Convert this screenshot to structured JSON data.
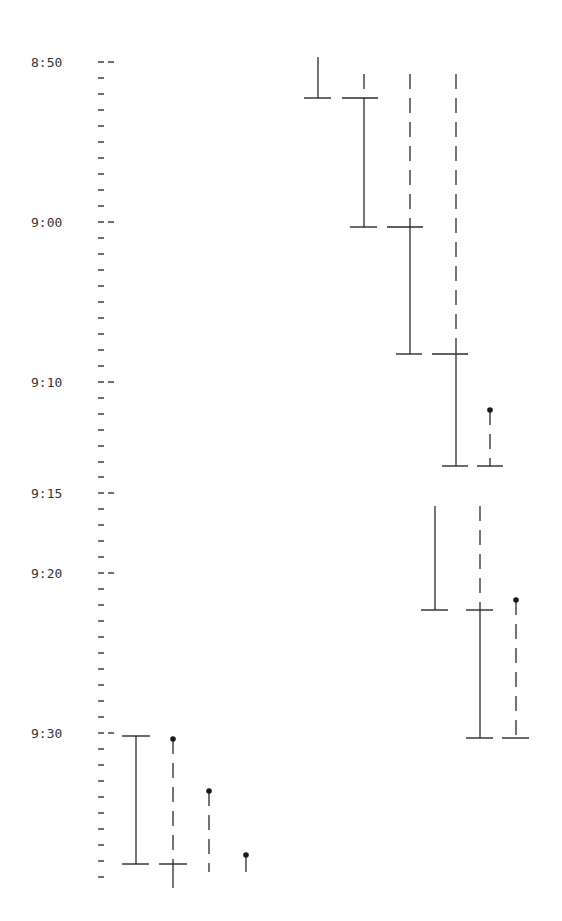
{
  "chart_data": {
    "type": "gantt-timeline",
    "title": "",
    "xlabel": "",
    "ylabel": "Time",
    "y_axis": {
      "direction": "downward",
      "range": [
        "8:50",
        "9:39"
      ],
      "labeled_ticks": [
        {
          "label": "8:50",
          "y": 62
        },
        {
          "label": "9:00",
          "y": 222
        },
        {
          "label": "9:10",
          "y": 382
        },
        {
          "label": "9:15",
          "y": 493
        },
        {
          "label": "9:20",
          "y": 573
        },
        {
          "label": "9:30",
          "y": 733
        }
      ],
      "minor_ticks_y": [
        78,
        94,
        110,
        126,
        142,
        158,
        174,
        190,
        206,
        238,
        254,
        270,
        286,
        302,
        318,
        334,
        350,
        366,
        398,
        414,
        430,
        446,
        462,
        477,
        509,
        525,
        541,
        557,
        589,
        605,
        621,
        637,
        653,
        669,
        685,
        701,
        717,
        749,
        765,
        781,
        797,
        813,
        829,
        845,
        861,
        877
      ]
    },
    "legend": {
      "solid_line": "active interval",
      "dashed_line": "waiting interval",
      "dot": "arrival / start marker",
      "crossbar": "interval boundary"
    },
    "groups": [
      {
        "name": "upper-group",
        "tracks": [
          {
            "x": 318,
            "segments": [
              {
                "style": "solid",
                "from": "8:50",
                "to": "8:52.5",
                "y1": 57,
                "y2": 98
              }
            ],
            "bars": [
              {
                "y": 98,
                "x1": 304,
                "x2": 331
              }
            ]
          },
          {
            "x": 364,
            "segments": [
              {
                "style": "dashed",
                "from": "8:50",
                "to": "8:52.5",
                "y1": 74,
                "y2": 98
              },
              {
                "style": "solid",
                "from": "8:52.5",
                "to": "9:00.3",
                "y1": 98,
                "y2": 227
              }
            ],
            "bars": [
              {
                "y": 98,
                "x1": 342,
                "x2": 378
              },
              {
                "y": 227,
                "x1": 350,
                "x2": 377
              }
            ]
          },
          {
            "x": 410,
            "segments": [
              {
                "style": "dashed",
                "from": "8:50",
                "to": "9:00.3",
                "y1": 74,
                "y2": 227
              },
              {
                "style": "solid",
                "from": "9:00.3",
                "to": "9:08.3",
                "y1": 227,
                "y2": 354
              }
            ],
            "bars": [
              {
                "y": 227,
                "x1": 387,
                "x2": 423
              },
              {
                "y": 354,
                "x1": 396,
                "x2": 422
              }
            ]
          },
          {
            "x": 456,
            "segments": [
              {
                "style": "dashed",
                "from": "8:50",
                "to": "9:08.3",
                "y1": 74,
                "y2": 354
              },
              {
                "style": "solid",
                "from": "9:08.3",
                "to": "9:13.3",
                "y1": 354,
                "y2": 466
              }
            ],
            "bars": [
              {
                "y": 354,
                "x1": 432,
                "x2": 468
              },
              {
                "y": 466,
                "x1": 442,
                "x2": 468
              }
            ]
          },
          {
            "x": 490,
            "dot_y": 410,
            "segments": [
              {
                "style": "dashed",
                "from": "9:11.8",
                "to": "9:13.3",
                "y1": 410,
                "y2": 466
              }
            ],
            "bars": [
              {
                "y": 466,
                "x1": 477,
                "x2": 503
              }
            ]
          }
        ]
      },
      {
        "name": "middle-group",
        "tracks": [
          {
            "x": 435,
            "segments": [
              {
                "style": "solid",
                "from": "9:15.8",
                "to": "9:22.3",
                "y1": 506,
                "y2": 610
              }
            ],
            "bars": [
              {
                "y": 610,
                "x1": 421,
                "x2": 448
              }
            ]
          },
          {
            "x": 480,
            "segments": [
              {
                "style": "dashed",
                "from": "9:15.8",
                "to": "9:22.3",
                "y1": 506,
                "y2": 610
              },
              {
                "style": "solid",
                "from": "9:22.3",
                "to": "9:30.3",
                "y1": 610,
                "y2": 738
              }
            ],
            "bars": [
              {
                "y": 610,
                "x1": 466,
                "x2": 493
              },
              {
                "y": 738,
                "x1": 466,
                "x2": 493
              }
            ]
          },
          {
            "x": 516,
            "dot_y": 600,
            "segments": [
              {
                "style": "dashed",
                "from": "9:21.7",
                "to": "9:30.3",
                "y1": 600,
                "y2": 738
              }
            ],
            "bars": [
              {
                "y": 738,
                "x1": 502,
                "x2": 529
              }
            ]
          }
        ]
      },
      {
        "name": "lower-group",
        "tracks": [
          {
            "x": 136,
            "segments": [
              {
                "style": "solid",
                "from": "9:30.2",
                "to": "9:38.2",
                "y1": 736,
                "y2": 864
              }
            ],
            "bars": [
              {
                "y": 736,
                "x1": 122,
                "x2": 150
              },
              {
                "y": 864,
                "x1": 122,
                "x2": 149
              }
            ]
          },
          {
            "x": 173,
            "dot_y": 739,
            "segments": [
              {
                "style": "dashed",
                "from": "9:30.4",
                "to": "9:38.2",
                "y1": 739,
                "y2": 864
              },
              {
                "style": "solid",
                "from": "9:38.2",
                "to": "9:39.7",
                "y1": 864,
                "y2": 888
              }
            ],
            "bars": [
              {
                "y": 864,
                "x1": 159,
                "x2": 187
              }
            ]
          },
          {
            "x": 209,
            "dot_y": 791,
            "segments": [
              {
                "style": "dashed",
                "from": "9:33.6",
                "to": "9:38.7",
                "y1": 791,
                "y2": 872
              }
            ],
            "bars": []
          },
          {
            "x": 246,
            "dot_y": 855,
            "segments": [
              {
                "style": "solid",
                "from": "9:37.6",
                "to": "9:38.7",
                "y1": 855,
                "y2": 872
              }
            ],
            "bars": []
          }
        ]
      }
    ]
  }
}
